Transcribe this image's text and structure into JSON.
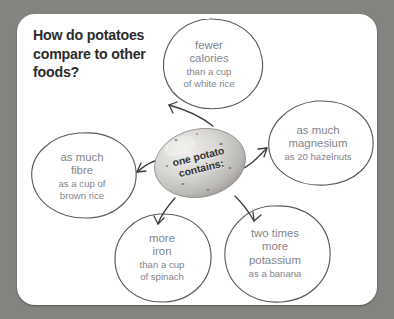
{
  "card": {
    "background_color": "#ffffff",
    "surround_color": "#83837f"
  },
  "title": {
    "line1": "How do potatoes",
    "line2": "compare to other",
    "line3": "foods?",
    "color": "#2b2b2b"
  },
  "center": {
    "label_line1": "one potato",
    "label_line2": "contains:",
    "image": "potato-photo"
  },
  "bubbles": [
    {
      "id": "calories",
      "headline_line1": "fewer",
      "headline_line2": "calories",
      "detail_line1": "than a cup",
      "detail_line2": "of white rice",
      "text_color": "#84848a"
    },
    {
      "id": "magnesium",
      "headline_line1": "as much",
      "headline_line2": "magnesium",
      "detail_line1": "as 20 hazelnuts",
      "detail_line2": "",
      "text_color": "#84848a"
    },
    {
      "id": "fibre",
      "headline_line1": "as much",
      "headline_line2": "fibre",
      "detail_line1": "as a cup of",
      "detail_line2": "brown rice",
      "text_color": "#84848a"
    },
    {
      "id": "iron",
      "headline_line1": "more",
      "headline_line2": "iron",
      "detail_line1": "than a cup",
      "detail_line2": "of spinach",
      "text_color": "#84848a"
    },
    {
      "id": "potassium",
      "headline_line1": "two times",
      "headline_line2": "more",
      "headline_line3": "potassium",
      "detail_line1": "as a banana",
      "detail_line2": "",
      "text_color": "#84848a"
    }
  ],
  "connectors": {
    "count": 5,
    "stroke_color": "#4a4a4a",
    "style": "hand-drawn-arrow"
  }
}
